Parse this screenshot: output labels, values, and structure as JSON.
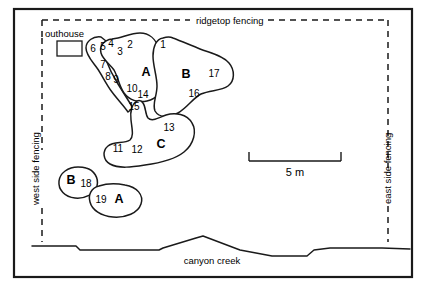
{
  "figure": {
    "type": "site-map",
    "title_visible": false,
    "width": 426,
    "height": 288,
    "background_color": "#ffffff",
    "ink_color": "#1a1a1a"
  },
  "labels": {
    "ridgetop_fencing": "ridgetop fencing",
    "west_side_fencing": "west side fencing",
    "east_side_fencing": "east side fencing",
    "outhouse": "outhouse",
    "canyon_creek": "canyon creek"
  },
  "scalebar": {
    "label": "5 m",
    "length_px": 92,
    "x_start": 249,
    "x_end": 341,
    "y": 152
  },
  "clusters": [
    {
      "id": "A-upper",
      "letter": "A",
      "letter_x": 146,
      "letter_y": 71,
      "features": [
        "6",
        "5",
        "4",
        "3",
        "2",
        "7",
        "8",
        "9",
        "10",
        "14",
        "15"
      ]
    },
    {
      "id": "B-upper",
      "letter": "B",
      "letter_x": 186,
      "letter_y": 73,
      "features": [
        "1",
        "17",
        "16"
      ]
    },
    {
      "id": "C-lower",
      "letter": "C",
      "letter_x": 161,
      "letter_y": 143,
      "features": [
        "13",
        "11",
        "12"
      ]
    },
    {
      "id": "B-lower",
      "letter": "B",
      "letter_x": 71,
      "letter_y": 179,
      "features": [
        "18"
      ]
    },
    {
      "id": "A-lower",
      "letter": "A",
      "letter_x": 119,
      "letter_y": 198,
      "features": [
        "19"
      ]
    }
  ],
  "feature_numbers": [
    {
      "n": "6",
      "x": 93,
      "y": 48
    },
    {
      "n": "5",
      "x": 103,
      "y": 46
    },
    {
      "n": "4",
      "x": 111,
      "y": 44
    },
    {
      "n": "3",
      "x": 120,
      "y": 51
    },
    {
      "n": "2",
      "x": 130,
      "y": 45
    },
    {
      "n": "7",
      "x": 103,
      "y": 64
    },
    {
      "n": "8",
      "x": 108,
      "y": 76
    },
    {
      "n": "9",
      "x": 115,
      "y": 79
    },
    {
      "n": "10",
      "x": 131,
      "y": 88
    },
    {
      "n": "14",
      "x": 142,
      "y": 94
    },
    {
      "n": "15",
      "x": 134,
      "y": 106
    },
    {
      "n": "1",
      "x": 163,
      "y": 44
    },
    {
      "n": "17",
      "x": 214,
      "y": 73
    },
    {
      "n": "16",
      "x": 194,
      "y": 93
    },
    {
      "n": "13",
      "x": 169,
      "y": 127
    },
    {
      "n": "11",
      "x": 117,
      "y": 148
    },
    {
      "n": "12",
      "x": 136,
      "y": 149
    },
    {
      "n": "18",
      "x": 85,
      "y": 183
    },
    {
      "n": "19",
      "x": 100,
      "y": 199
    }
  ]
}
